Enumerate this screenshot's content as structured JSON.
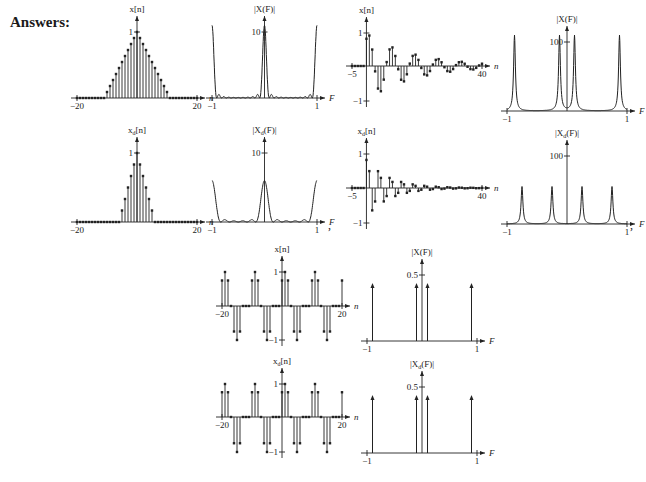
{
  "heading": "Answers:",
  "separators": [
    ",",
    ","
  ],
  "chart_data": [
    {
      "id": "p1",
      "type": "stem",
      "title": "x[n]",
      "xlabel": "n",
      "xlim": [
        -20,
        20
      ],
      "ylim": [
        0,
        1
      ],
      "xticks": [
        {
          "v": -20,
          "label": "−20"
        },
        {
          "v": 20,
          "label": "20"
        }
      ],
      "yticks": [
        {
          "v": 1,
          "label": "1"
        }
      ],
      "signal": "triangle",
      "params": {
        "half_width": 10
      },
      "box": {
        "x": 65,
        "y": 18,
        "w": 150,
        "h": 110,
        "ox": 75,
        "yaxis_x": 0.5,
        "base_y": 98,
        "top_y": 32
      }
    },
    {
      "id": "p2",
      "type": "line",
      "title": "|X(F)|",
      "xlabel": "F",
      "xlim": [
        -1,
        1
      ],
      "ylim": [
        0,
        10
      ],
      "xticks": [
        {
          "v": -1,
          "label": "−1"
        },
        {
          "v": 1,
          "label": "1"
        }
      ],
      "yticks": [
        {
          "v": 10,
          "label": "10"
        }
      ],
      "signal": "fejer",
      "params": {
        "N": 10
      },
      "box": {
        "x": 200,
        "y": 18,
        "w": 135,
        "h": 110,
        "base_y": 98,
        "top_y": 32
      }
    },
    {
      "id": "p3",
      "type": "stem",
      "title": "x[n]",
      "xlabel": "n",
      "xlim": [
        -5,
        40
      ],
      "ylim": [
        -1,
        1
      ],
      "xticks": [
        {
          "v": -5,
          "label": "−5"
        },
        {
          "v": 40,
          "label": "40"
        }
      ],
      "yticks": [
        {
          "v": 1,
          "label": "1"
        },
        {
          "v": -1,
          "label": "−1"
        }
      ],
      "signal": "damped_cos",
      "params": {
        "A": 1,
        "F0": 0.125,
        "decay": 0.94,
        "phase": -0.6
      },
      "box": {
        "x": 340,
        "y": 10,
        "w": 160,
        "h": 115,
        "base_y": 66,
        "top_y": 33,
        "bot_y": 101
      }
    },
    {
      "id": "p4",
      "type": "line",
      "title": "|X(F)|",
      "xlabel": "F",
      "xlim": [
        -1,
        1
      ],
      "ylim": [
        0,
        100
      ],
      "xticks": [
        {
          "v": -1,
          "label": "−1"
        },
        {
          "v": 1,
          "label": "1"
        }
      ],
      "yticks": [
        {
          "v": 100,
          "label": "100"
        }
      ],
      "signal": "resonance",
      "params": {
        "peaks": [
          -0.875,
          -0.125,
          0.125,
          0.875
        ],
        "height": 110
      },
      "box": {
        "x": 495,
        "y": 10,
        "w": 150,
        "h": 115,
        "base_y": 111,
        "top_y": 42
      }
    },
    {
      "id": "p5",
      "type": "stem",
      "title": "x_d[n]",
      "xlabel": "n",
      "xlim": [
        -20,
        20
      ],
      "ylim": [
        0,
        1
      ],
      "xticks": [
        {
          "v": -20,
          "label": "−20"
        },
        {
          "v": 20,
          "label": "20"
        }
      ],
      "yticks": [
        {
          "v": 1,
          "label": "1"
        }
      ],
      "signal": "triangle_decimated",
      "params": {
        "half_width": 5
      },
      "box": {
        "x": 65,
        "y": 128,
        "w": 150,
        "h": 110,
        "base_y": 222,
        "top_y": 153
      }
    },
    {
      "id": "p6",
      "type": "line",
      "title": "|X_d(F)|",
      "xlabel": "F",
      "xlim": [
        -1,
        1
      ],
      "ylim": [
        0,
        10
      ],
      "xticks": [
        {
          "v": -1,
          "label": "−1"
        },
        {
          "v": 1,
          "label": "1"
        }
      ],
      "yticks": [
        {
          "v": 10,
          "label": "10"
        }
      ],
      "signal": "fejer",
      "params": {
        "N": 5
      },
      "box": {
        "x": 200,
        "y": 128,
        "w": 135,
        "h": 110,
        "base_y": 222,
        "top_y": 153
      }
    },
    {
      "id": "p7",
      "type": "stem",
      "title": "x_d[n]",
      "xlabel": "n",
      "xlim": [
        -5,
        40
      ],
      "ylim": [
        -1,
        1
      ],
      "xticks": [
        {
          "v": -5,
          "label": "−5"
        },
        {
          "v": 40,
          "label": "40"
        }
      ],
      "yticks": [
        {
          "v": 1,
          "label": "1"
        },
        {
          "v": -1,
          "label": "−1"
        }
      ],
      "signal": "damped_cos_dec",
      "params": {
        "A": 1,
        "F0": 0.25,
        "decay": 0.88,
        "phase": -0.6
      },
      "box": {
        "x": 340,
        "y": 128,
        "w": 160,
        "h": 115,
        "base_y": 188,
        "top_y": 154,
        "bot_y": 223
      }
    },
    {
      "id": "p8",
      "type": "line",
      "title": "|X_d(F)|",
      "xlabel": "F",
      "xlim": [
        -1,
        1
      ],
      "ylim": [
        0,
        100
      ],
      "xticks": [
        {
          "v": -1,
          "label": "−1"
        },
        {
          "v": 1,
          "label": "1"
        }
      ],
      "yticks": [
        {
          "v": 100,
          "label": "100"
        }
      ],
      "signal": "resonance",
      "params": {
        "peaks": [
          -0.75,
          -0.25,
          0.25,
          0.75
        ],
        "height": 55
      },
      "box": {
        "x": 495,
        "y": 128,
        "w": 150,
        "h": 115,
        "base_y": 224,
        "top_y": 156
      }
    },
    {
      "id": "p9",
      "type": "stem",
      "title": "x[n]",
      "xlabel": "n",
      "xlim": [
        -20,
        20
      ],
      "ylim": [
        -1,
        1
      ],
      "xticks": [
        {
          "v": -20,
          "label": "−20"
        },
        {
          "v": 20,
          "label": "20"
        }
      ],
      "yticks": [
        {
          "v": 1,
          "label": "1"
        },
        {
          "v": -1,
          "label": "−1"
        }
      ],
      "signal": "sum_cos",
      "params": {
        "period": 10
      },
      "box": {
        "x": 210,
        "y": 243,
        "w": 150,
        "h": 115,
        "base_y": 306,
        "top_y": 272,
        "bot_y": 340
      }
    },
    {
      "id": "p10",
      "type": "impulses",
      "title": "|X(F)|",
      "xlabel": "F",
      "xlim": [
        -1,
        1
      ],
      "ylim": [
        0,
        0.5
      ],
      "xticks": [
        {
          "v": -1,
          "label": "−1"
        },
        {
          "v": 1,
          "label": "1"
        }
      ],
      "yticks": [
        {
          "v": 0.5,
          "label": "0.5"
        }
      ],
      "impulses": [
        -0.9,
        -0.1,
        0.1,
        0.9
      ],
      "box": {
        "x": 355,
        "y": 243,
        "w": 140,
        "h": 115,
        "base_y": 341,
        "top_y": 275
      }
    },
    {
      "id": "p11",
      "type": "stem",
      "title": "x_d[n]",
      "xlabel": "n",
      "xlim": [
        -20,
        20
      ],
      "ylim": [
        -1,
        1
      ],
      "xticks": [
        {
          "v": -20,
          "label": "−20"
        },
        {
          "v": 20,
          "label": "20"
        }
      ],
      "yticks": [
        {
          "v": 1,
          "label": "1"
        },
        {
          "v": -1,
          "label": "−1"
        }
      ],
      "signal": "sum_cos",
      "params": {
        "period": 10
      },
      "box": {
        "x": 210,
        "y": 358,
        "w": 150,
        "h": 115,
        "base_y": 417,
        "top_y": 384,
        "bot_y": 452
      }
    },
    {
      "id": "p12",
      "type": "impulses",
      "title": "|X_d(F)|",
      "xlabel": "F",
      "xlim": [
        -1,
        1
      ],
      "ylim": [
        0,
        0.5
      ],
      "xticks": [
        {
          "v": -1,
          "label": "−1"
        },
        {
          "v": 1,
          "label": "1"
        }
      ],
      "yticks": [
        {
          "v": 0.5,
          "label": "0.5"
        }
      ],
      "impulses": [
        -0.9,
        -0.1,
        0.1,
        0.9
      ],
      "box": {
        "x": 355,
        "y": 358,
        "w": 140,
        "h": 120,
        "base_y": 453,
        "top_y": 387
      }
    }
  ]
}
